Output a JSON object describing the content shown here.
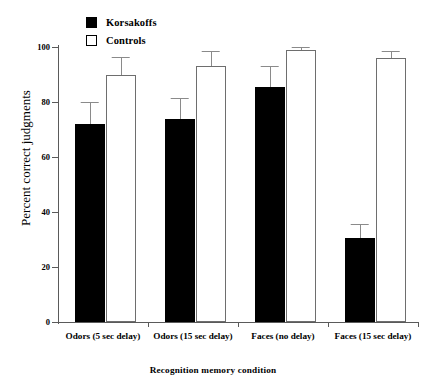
{
  "chart_data": {
    "type": "bar",
    "title": "",
    "xlabel": "Recognition memory condition",
    "ylabel": "Percent correct judgments",
    "ylim": [
      0,
      100
    ],
    "yticks": [
      0,
      20,
      40,
      60,
      80,
      100
    ],
    "grid": false,
    "legend_position": "top-left",
    "categories": [
      "Odors (5 sec delay)",
      "Odors (15 sec delay)",
      "Faces (no delay)",
      "Faces (15 sec delay)"
    ],
    "series": [
      {
        "name": "Korsakoffs",
        "color": "#000000",
        "fill": "solid",
        "values": [
          72,
          74,
          85.5,
          30.5
        ],
        "errors": [
          8,
          7.5,
          7.5,
          5
        ]
      },
      {
        "name": "Controls",
        "color": "#ffffff",
        "fill": "hollow",
        "values": [
          90,
          93,
          99,
          96
        ],
        "errors": [
          6.5,
          5.5,
          1,
          2.5
        ]
      }
    ]
  },
  "legend": {
    "items": [
      {
        "label": "Korsakoffs",
        "swatch": "filled-square"
      },
      {
        "label": "Controls",
        "swatch": "hollow-square"
      }
    ]
  },
  "axes": {
    "y_title": "Percent correct judgments",
    "x_title": "Recognition memory condition",
    "y_tick_labels": [
      "100",
      "80",
      "60",
      "40",
      "20",
      "0"
    ]
  }
}
